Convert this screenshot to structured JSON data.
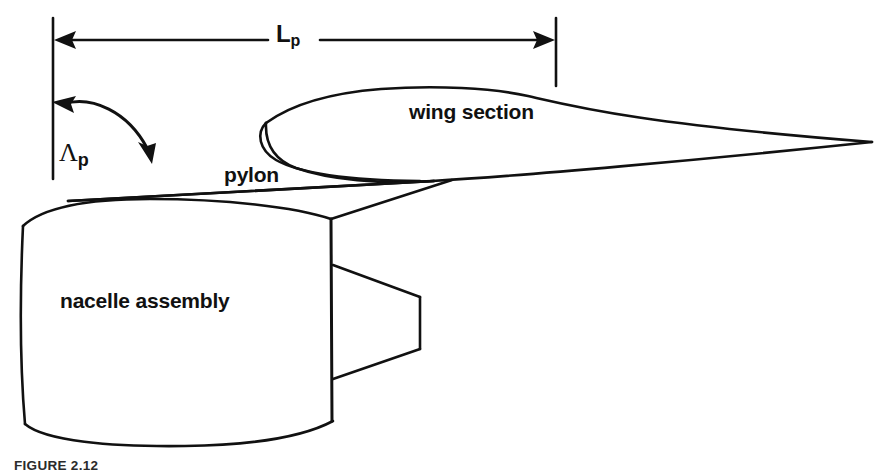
{
  "figure": {
    "caption": "FIGURE 2.12",
    "background_color": "#ffffff",
    "ink_color": "#111111",
    "width_px": 893,
    "height_px": 472
  },
  "labels": {
    "wing_section": "wing section",
    "pylon": "pylon",
    "nacelle_assembly": "nacelle assembly",
    "length_symbol": "L",
    "length_subscript": "p",
    "sweep_symbol": "Λ",
    "sweep_subscript": "p"
  },
  "annotations": {
    "dimension_lp": {
      "name": "pylon length",
      "symbol": "L_p",
      "type": "double-headed-dimension-arrow",
      "left_extension_line_x": 53,
      "right_extension_line_x": 556,
      "arrow_y": 40
    },
    "angle_lambda_p": {
      "name": "pylon sweep angle",
      "symbol": "Lambda_p",
      "type": "curved-angle-arrow",
      "from": "vertical reference line",
      "to": "pylon leading edge"
    }
  },
  "components": [
    {
      "id": "wing-section",
      "label": "wing section",
      "description": "airfoil cross-section with rounded leading edge and sharp trailing edge"
    },
    {
      "id": "pylon",
      "label": "pylon",
      "description": "swept strut joining nacelle to wing"
    },
    {
      "id": "nacelle-assembly",
      "label": "nacelle assembly",
      "description": "engine nacelle barrel with exhaust nozzle"
    }
  ]
}
